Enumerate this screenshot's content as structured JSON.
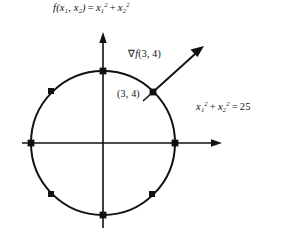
{
  "figure": {
    "background_color": "#ffffff",
    "stroke_color": "#111111",
    "labels": {
      "objective_function": {
        "prefix": "f",
        "args": "(x",
        "arg1_sub": "1",
        "args_mid": ", x",
        "arg2_sub": "2",
        "args_close": ")",
        "equals": "=",
        "term1_var": "x",
        "term1_sub": "1",
        "term1_sup": "2",
        "plus": "+",
        "term2_var": "x",
        "term2_sub": "2",
        "term2_sup": "2",
        "plain": "f(x1, x2) = x1^2 + x2^2"
      },
      "constraint_equation": {
        "term1_var": "x",
        "term1_sub": "1",
        "term1_sup": "2",
        "plus": "+",
        "term2_var": "x",
        "term2_sub": "2",
        "term2_sup": "2",
        "equals": "=",
        "value": "25",
        "plain": "x1^2 + x2^2 = 25"
      },
      "gradient_label": {
        "nabla": "∇",
        "func": "f",
        "point": "(3, 4)",
        "plain": "∇f(3, 4)"
      },
      "point_label": {
        "text": "(3, 4)"
      }
    },
    "geometry": {
      "origin": {
        "x": 103,
        "y": 143
      },
      "circle_radius": 72,
      "circle_equation_radius_value": 5,
      "x_axis": {
        "x_start": 22,
        "x_end": 222,
        "y": 143,
        "arrow_at": "right"
      },
      "y_axis": {
        "y_start": 32,
        "y_end": 228,
        "x": 103,
        "arrow_at": "top"
      },
      "gradient_vector": {
        "tail": {
          "x": 153,
          "y": 92
        },
        "tip": {
          "x": 204,
          "y": 46
        },
        "point_on_circle": {
          "x1": 3,
          "x2": 4
        }
      },
      "markers": [
        {
          "name": "top-intercept",
          "x": 103,
          "y": 71
        },
        {
          "name": "right-intercept",
          "x": 175,
          "y": 143
        },
        {
          "name": "bottom-intercept",
          "x": 103,
          "y": 215
        },
        {
          "name": "left-intercept",
          "x": 31,
          "y": 143
        },
        {
          "name": "point-3-4",
          "x": 153,
          "y": 92
        },
        {
          "name": "upper-left-point",
          "x": 51,
          "y": 91
        },
        {
          "name": "lower-left-point",
          "x": 51,
          "y": 194
        },
        {
          "name": "lower-right-point",
          "x": 152,
          "y": 194
        }
      ]
    }
  }
}
